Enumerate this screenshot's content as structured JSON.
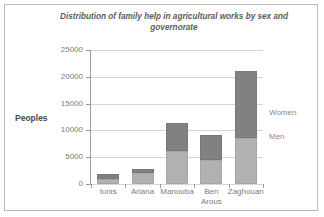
{
  "chart_data": {
    "type": "bar",
    "stacked": true,
    "title": "Distribution of family help in agricultural  works by sex and governorate",
    "xlabel": "",
    "ylabel": "Peoples",
    "ylim": [
      0,
      25000
    ],
    "yticks": [
      "0",
      "5000",
      "10000",
      "15000",
      "20000",
      "25000"
    ],
    "grid": true,
    "legend_position": "right-inside",
    "categories": [
      "tunis",
      "Ariana",
      "Manouba",
      "Ben Arous",
      "Zaghouan"
    ],
    "category_lines": [
      [
        "tunis"
      ],
      [
        "Ariana"
      ],
      [
        "Manouba"
      ],
      [
        "Ben",
        "Arous"
      ],
      [
        "Zaghouan"
      ]
    ],
    "series": [
      {
        "name": "Men",
        "color": "#b2b2b2",
        "values": [
          1000,
          2000,
          6100,
          4400,
          8600
        ]
      },
      {
        "name": "Women",
        "color": "#818181",
        "values": [
          800,
          800,
          5200,
          4700,
          12400
        ]
      }
    ],
    "totals": [
      1800,
      2800,
      11300,
      9100,
      21000
    ]
  },
  "axis": {
    "y_title": "Peoples"
  },
  "legend": {
    "women_label": "Women",
    "men_label": "Men"
  }
}
